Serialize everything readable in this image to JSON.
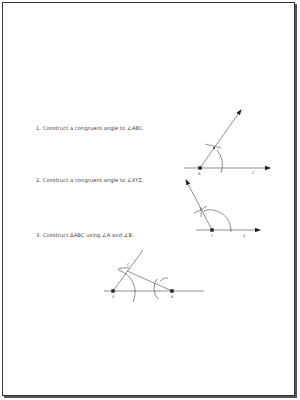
{
  "questions": [
    {
      "number": "1.",
      "text": "Construct a congruent angle to ∠ABC."
    },
    {
      "number": "2.",
      "text": "Construct a congruent angle to ∠XYZ."
    },
    {
      "number": "3.",
      "text": "Construct ΔABC using ∠A and ∠B."
    }
  ],
  "figures": {
    "fig1": {
      "vertex": "B",
      "ray_point": "C"
    },
    "fig2": {
      "vertex": "Y",
      "ray_point": "Z"
    },
    "fig3": {
      "points": [
        "A",
        "B",
        "C"
      ]
    }
  },
  "colors": {
    "ink": "#222222",
    "border": "#333333",
    "text": "#444444"
  }
}
